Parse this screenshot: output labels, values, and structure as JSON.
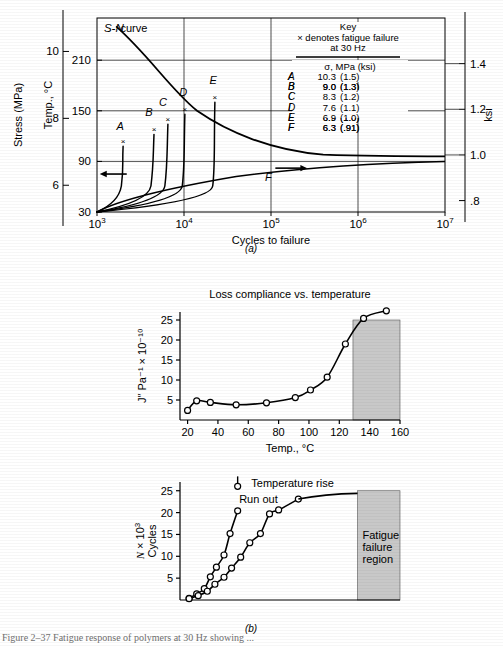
{
  "figure": {
    "panel_a_caption": "(a)",
    "panel_b_caption": "(b)",
    "bottom_caption": "Figure 2–37   Fatigue response of polymers at 30 Hz showing ..."
  },
  "chart_data": [
    {
      "id": "panel-a",
      "type": "line",
      "title": "",
      "xlabel": "Cycles to failure",
      "ylabel_left_outer": "Stress (MPa)",
      "ylabel_left_inner": "Temp., °C",
      "ylabel_right": "ksi",
      "xlim_log": [
        3,
        7
      ],
      "xticks": [
        "10³",
        "10⁴",
        "10⁵",
        "10⁶",
        "10⁷"
      ],
      "xtick_exponents": [
        3,
        4,
        5,
        6,
        7
      ],
      "stress_ticks": [
        6,
        8,
        10
      ],
      "stress_lim": [
        5.2,
        11.0
      ],
      "temp_ticks": [
        30,
        90,
        150,
        210
      ],
      "temp_lim": [
        30,
        260
      ],
      "ksi_ticks": [
        ".8",
        "1.0",
        "1.2",
        "1.4"
      ],
      "ksi_tick_values": [
        0.8,
        1.0,
        1.2,
        1.4
      ],
      "ksi_lim": [
        0.75,
        1.6
      ],
      "sn_curve_label": "S-N curve",
      "arrow_left": "←",
      "arrow_right": "→",
      "series_labels": [
        "A",
        "B",
        "C",
        "D",
        "E",
        "F"
      ],
      "failure_marker": "×",
      "grid": true,
      "legend_position": "inside-top-right"
    },
    {
      "id": "panel-b-top",
      "type": "line",
      "title": "Loss compliance vs. temperature",
      "xlabel": "Temp., °C",
      "ylabel": "J″  Pa⁻¹ × 10⁻¹⁰",
      "xlim": [
        15,
        160
      ],
      "xticks": [
        20,
        40,
        60,
        80,
        100,
        120,
        140,
        160
      ],
      "ylim": [
        0,
        27
      ],
      "yticks": [
        5,
        10,
        15,
        20,
        25
      ],
      "x": [
        20,
        26,
        35,
        52,
        72,
        91,
        101,
        112,
        124,
        136,
        151
      ],
      "y": [
        2.4,
        4.8,
        4.4,
        3.8,
        4.3,
        5.6,
        7.5,
        10.7,
        19.0,
        25.4,
        27.3
      ],
      "shaded_region": {
        "x_start": 129,
        "x_end": 160,
        "y_top": 25,
        "color": "#c8c8c8"
      },
      "grid": false,
      "marker": "open-circle"
    },
    {
      "id": "panel-b-bottom",
      "type": "line",
      "title": "Temperature rise",
      "xlabel": "",
      "ylabel": "N × 10³ Cycles",
      "xlim": [
        15,
        160
      ],
      "xticks": [
        20,
        40,
        60,
        80,
        100,
        120,
        140,
        160
      ],
      "ylim": [
        0,
        27
      ],
      "yticks": [
        5,
        10,
        15,
        20,
        25
      ],
      "series": [
        {
          "name": "Run out",
          "x": [
            21,
            26,
            31,
            35,
            39,
            44,
            48,
            53
          ],
          "y": [
            0.4,
            1.4,
            2.6,
            5.3,
            7.5,
            10.3,
            15.2,
            20.4
          ]
        },
        {
          "name": "Temperature rise",
          "x": [
            21,
            27,
            33,
            38,
            44,
            49,
            55,
            61,
            68,
            74,
            80,
            93
          ],
          "y": [
            0.3,
            1.0,
            2.0,
            3.6,
            5.2,
            7.3,
            9.8,
            13.1,
            15.2,
            19.7,
            20.6,
            23.1
          ]
        }
      ],
      "runout_top_point": {
        "x": 53,
        "y": 26.0
      },
      "label_run_out": "Run out",
      "label_temperature_rise": "Temperature rise",
      "shaded_region": {
        "x_start": 132,
        "x_end": 160,
        "y_top": 25,
        "color": "#c8c8c8"
      },
      "shaded_region_label": [
        "Fatigue",
        "failure",
        "region"
      ],
      "grid": false,
      "marker": "open-circle"
    }
  ],
  "key": {
    "title": "Key",
    "subtitle_1": "× denotes fatigue failure",
    "subtitle_2": "at 30 Hz",
    "column_header": "σ, MPa (ksi)",
    "rows": [
      {
        "label": "A",
        "mpa": "10.3",
        "ksi": "(1.5)"
      },
      {
        "label": "B",
        "mpa": "9.0",
        "ksi": "(1.3)"
      },
      {
        "label": "C",
        "mpa": "8.3",
        "ksi": "(1.2)"
      },
      {
        "label": "D",
        "mpa": "7.6",
        "ksi": "(1.1)"
      },
      {
        "label": "E",
        "mpa": "6.9",
        "ksi": "(1.0)"
      },
      {
        "label": "F",
        "mpa": "6.3",
        "ksi": "(.91)"
      }
    ]
  }
}
